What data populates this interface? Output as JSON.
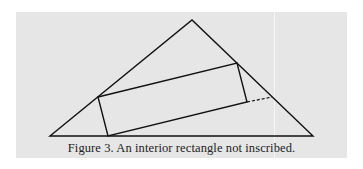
{
  "figure": {
    "caption": "Figure 3. An interior rectangle not inscribed.",
    "colors": {
      "background": "#e6e6e6",
      "stroke": "#111111",
      "caption": "#222222"
    },
    "triangle": {
      "left": [
        50,
        136
      ],
      "apex": [
        192,
        20
      ],
      "right": [
        313,
        136
      ]
    },
    "rectangle": {
      "top_left": [
        98,
        97
      ],
      "top_right": [
        237,
        63
      ],
      "bottom_right": [
        247,
        102
      ],
      "bottom_left": [
        108,
        136
      ]
    },
    "dashed_extension": {
      "from": [
        247,
        102
      ],
      "to": [
        272,
        97
      ]
    }
  }
}
